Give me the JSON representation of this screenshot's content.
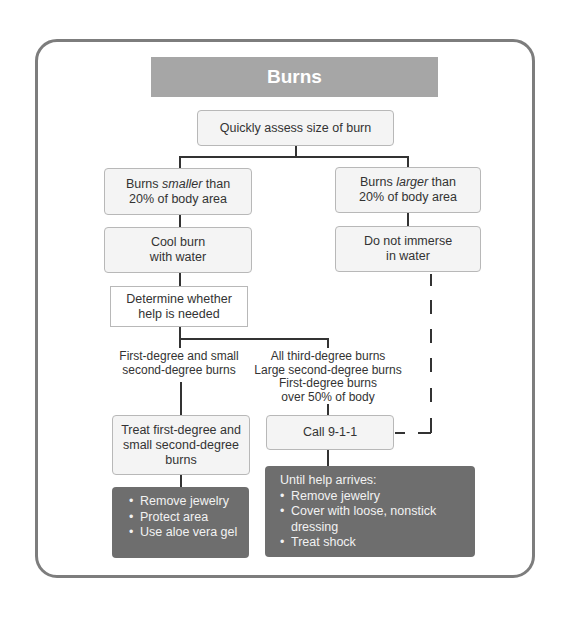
{
  "title": "Burns",
  "colors": {
    "title_bar": "#a6a6a6",
    "frame_border": "#7d7d7d",
    "light_box": "#f4f4f4",
    "dark_box": "#6e6e6e"
  },
  "nodes": {
    "assess": "Quickly assess size of burn",
    "smaller": {
      "pre": "Burns ",
      "em": "smaller",
      "post": " than",
      "line2": "20% of body area"
    },
    "larger": {
      "pre": "Burns ",
      "em": "larger",
      "post": " than",
      "line2": "20% of body area"
    },
    "cool": {
      "line1": "Cool burn",
      "line2": "with water"
    },
    "no_immerse": {
      "line1": "Do not immerse",
      "line2": "in water"
    },
    "determine": {
      "line1": "Determine whether",
      "line2": "help is needed"
    },
    "minor_label": {
      "line1": "First-degree and small",
      "line2": "second-degree burns"
    },
    "major_label": {
      "line1": "All third-degree burns",
      "line2": "Large second-degree burns",
      "line3": "First-degree burns",
      "line4": "over 50% of body"
    },
    "treat": {
      "line1": "Treat first-degree and",
      "line2": "small second-degree",
      "line3": "burns"
    },
    "call": "Call 9-1-1",
    "minor_care": [
      "Remove jewelry",
      "Protect area",
      "Use aloe vera gel"
    ],
    "major_care": {
      "heading": "Until help arrives:",
      "items": [
        "Remove jewelry",
        "Cover with loose, nonstick dressing",
        "Treat shock"
      ]
    }
  }
}
